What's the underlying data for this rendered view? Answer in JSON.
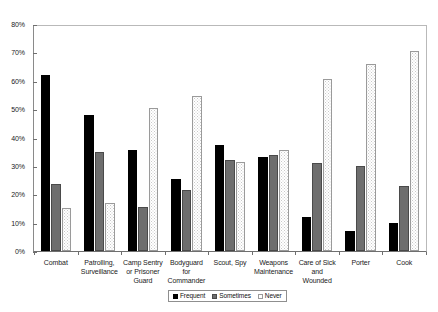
{
  "chart_data": {
    "type": "bar",
    "title": "",
    "subtitle": "",
    "xlabel": "",
    "ylabel": "",
    "ylim": [
      0,
      80
    ],
    "ytick_labels": [
      "0%",
      "10%",
      "20%",
      "30%",
      "40%",
      "50%",
      "60%",
      "70%",
      "80%"
    ],
    "ytick_values": [
      0,
      10,
      20,
      30,
      40,
      50,
      60,
      70,
      80
    ],
    "grid": false,
    "legend_position": "bottom-center",
    "categories": [
      "Combat",
      "Patrolling, Surveillance",
      "Camp Sentry or Prisoner Guard",
      "Bodyguard for Commander",
      "Scout, Spy",
      "Weapons Maintenance",
      "Care of Sick and Wounded",
      "Porter",
      "Cook"
    ],
    "category_lines": [
      [
        "Combat"
      ],
      [
        "Patrolling,",
        "Surveillance"
      ],
      [
        "Camp Sentry",
        "or Prisoner",
        "Guard"
      ],
      [
        "Bodyguard",
        "for",
        "Commander"
      ],
      [
        "Scout, Spy"
      ],
      [
        "Weapons",
        "Maintenance"
      ],
      [
        "Care of Sick",
        "and",
        "Wounded"
      ],
      [
        "Porter"
      ],
      [
        "Cook"
      ]
    ],
    "series": [
      {
        "name": "Frequent",
        "key": "frequent",
        "color": "#000000",
        "values": [
          62,
          48,
          35.5,
          25.5,
          37.5,
          33,
          12,
          7,
          10
        ]
      },
      {
        "name": "Sometimes",
        "key": "sometimes",
        "color": "#6e6e6e",
        "values": [
          23.5,
          35,
          15.5,
          21.5,
          32,
          34,
          31,
          30,
          23
        ]
      },
      {
        "name": "Never",
        "key": "never",
        "color": "#ffffff",
        "values": [
          15,
          17,
          50.5,
          54.5,
          31.5,
          35.5,
          60.5,
          66,
          70.5
        ]
      }
    ]
  },
  "legend": {
    "items": [
      {
        "label": "Frequent",
        "key": "frequent"
      },
      {
        "label": "Sometimes",
        "key": "sometimes"
      },
      {
        "label": "Never",
        "key": "never"
      }
    ]
  }
}
